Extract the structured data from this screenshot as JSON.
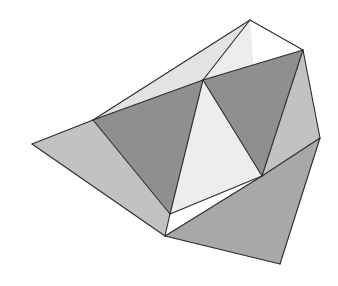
{
  "figure": {
    "canvas": {
      "width": 338,
      "height": 286,
      "background": "#ffffff"
    },
    "stroke": {
      "color": "#2b2b2b",
      "width": 1.1
    },
    "palette": {
      "background": "#ffffff",
      "lightest": "#ededed",
      "light": "#e3e3e3",
      "light_mid": "#d5d5d5",
      "mid": "#c2c2c2",
      "mid_dark": "#a8a8a8",
      "dark": "#8f8f8f",
      "darkest": "#7e7e7e",
      "outline": "#2b2b2b"
    },
    "vertices": {
      "solid_a": {
        "top_apex": [
          250,
          20
        ],
        "left": [
          93,
          120
        ],
        "bottom": [
          170,
          214
        ],
        "right": [
          262,
          176
        ]
      },
      "solid_b": {
        "top_right": [
          303,
          50
        ],
        "far_left": [
          32,
          144
        ],
        "bottom_right": [
          280,
          264
        ],
        "inner": [
          203,
          80
        ]
      }
    },
    "faces": [
      {
        "name": "solid-a-top-face",
        "points": "250,20 93,120 203,80",
        "fill": "#e3e3e3"
      },
      {
        "name": "solid-a-upper-right-face",
        "points": "250,20 203,80 262,176",
        "fill": "#ededed"
      },
      {
        "name": "solid-a-left-face",
        "points": "93,120 203,80 170,214",
        "fill": "#8f8f8f"
      },
      {
        "name": "solid-a-lower-face",
        "points": "203,80 262,176 170,214",
        "fill": "#ededed"
      },
      {
        "name": "solid-b-left-wing-face",
        "points": "32,144 93,120 170,214 165,236",
        "fill": "#c2c2c2"
      },
      {
        "name": "solid-b-upper-face",
        "points": "303,50 203,80 262,176",
        "fill": "#8f8f8f"
      },
      {
        "name": "solid-b-right-face",
        "points": "303,50 262,176 320,138",
        "fill": "#c2c2c2"
      },
      {
        "name": "solid-b-lower-right-face",
        "points": "262,176 320,138 280,264 165,236",
        "fill": "#a8a8a8"
      },
      {
        "name": "solid-b-bottom-sliver",
        "points": "165,236 262,176 280,264",
        "fill": "#a8a8a8"
      }
    ],
    "edges": [
      {
        "name": "edge-apex-to-left",
        "from": [
          250,
          20
        ],
        "to": [
          93,
          120
        ]
      },
      {
        "name": "edge-apex-to-inner",
        "from": [
          250,
          20
        ],
        "to": [
          203,
          80
        ]
      },
      {
        "name": "edge-apex-to-right-top",
        "from": [
          250,
          20
        ],
        "to": [
          303,
          50
        ]
      },
      {
        "name": "edge-left-to-inner",
        "from": [
          93,
          120
        ],
        "to": [
          203,
          80
        ]
      },
      {
        "name": "edge-left-to-bottom",
        "from": [
          93,
          120
        ],
        "to": [
          170,
          214
        ]
      },
      {
        "name": "edge-inner-to-bottom",
        "from": [
          203,
          80
        ],
        "to": [
          170,
          214
        ]
      },
      {
        "name": "edge-inner-to-right",
        "from": [
          203,
          80
        ],
        "to": [
          262,
          176
        ]
      },
      {
        "name": "edge-inner-to-topright",
        "from": [
          203,
          80
        ],
        "to": [
          303,
          50
        ]
      },
      {
        "name": "edge-bottom-to-right",
        "from": [
          170,
          214
        ],
        "to": [
          262,
          176
        ]
      },
      {
        "name": "edge-topright-to-right",
        "from": [
          303,
          50
        ],
        "to": [
          262,
          176
        ]
      },
      {
        "name": "edge-topright-to-farright",
        "from": [
          303,
          50
        ],
        "to": [
          320,
          138
        ]
      },
      {
        "name": "edge-farright-to-botright",
        "from": [
          320,
          138
        ],
        "to": [
          280,
          264
        ]
      },
      {
        "name": "edge-botright-to-conv",
        "from": [
          280,
          264
        ],
        "to": [
          165,
          236
        ]
      },
      {
        "name": "edge-conv-to-farleft",
        "from": [
          165,
          236
        ],
        "to": [
          32,
          144
        ]
      },
      {
        "name": "edge-farleft-to-left",
        "from": [
          32,
          144
        ],
        "to": [
          93,
          120
        ]
      },
      {
        "name": "edge-conv-to-bottom",
        "from": [
          165,
          236
        ],
        "to": [
          170,
          214
        ]
      },
      {
        "name": "edge-conv-to-right",
        "from": [
          165,
          236
        ],
        "to": [
          262,
          176
        ]
      },
      {
        "name": "edge-right-to-farright",
        "from": [
          262,
          176
        ],
        "to": [
          320,
          138
        ]
      }
    ]
  }
}
